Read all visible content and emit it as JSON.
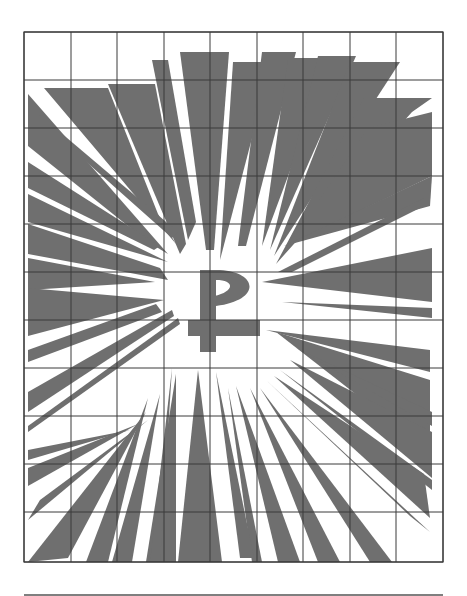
{
  "figure": {
    "center_symbol": "Chi-Rho (P with crossbar)",
    "fill_color": "#6f6f6f",
    "grid_color": "#3a3a3a",
    "background_color": "#ffffff"
  },
  "grid": {
    "left": 24,
    "right": 443,
    "top": 32,
    "bottom": 562,
    "columns": 9,
    "rows": 11,
    "vertical_lines_x": [
      24,
      71,
      117,
      164,
      210,
      257,
      303,
      350,
      396,
      443
    ],
    "horizontal_lines_y": [
      32,
      80,
      128,
      176,
      224,
      272,
      320,
      368,
      416,
      464,
      512,
      562
    ]
  },
  "divider": {
    "x1": 24,
    "x2": 443,
    "y": 595
  },
  "rays": [
    "28,94 28,146 148,242 168,254",
    "44,88 108,88 158,214 176,244",
    "108,84 155,84 186,244 180,254",
    "152,60 168,60 196,222 188,240",
    "180,52 229,52 214,250 206,250",
    "233,62 272,62 220,260",
    "262,52 296,52 246,246 238,246",
    "288,58 332,58 262,246",
    "318,56 356,56 270,250",
    "350,62 400,62 274,256",
    "364,98 432,98 412,112 276,264",
    "368,128 432,112 432,176 288,246",
    "284,246 432,176 430,206",
    "278,272 428,196 428,204 292,272",
    "28,110 34,110 178,232 172,238",
    "28,162 160,246 154,250 28,188",
    "28,194 168,262 28,222",
    "28,224 160,268 168,280 28,254",
    "28,258 155,282 28,290",
    "28,288 164,300 28,336",
    "28,350 156,304 162,312 28,362",
    "28,392 172,310 174,316 28,412",
    "28,426 178,318 180,324 28,432",
    "262,282 432,248 432,302",
    "282,302 432,308 432,318",
    "266,330 430,350 430,372",
    "276,332 430,380 430,452",
    "296,348 432,412 432,426",
    "290,360 432,432 432,478",
    "280,370 432,480 432,490",
    "274,376 424,474 430,518",
    "266,380 410,516 430,532",
    "260,388 392,562 370,562",
    "250,388 340,562 318,562",
    "236,386 300,562 278,562",
    "228,388 262,562 252,562",
    "216,372 254,558 240,558",
    "198,370 222,562 178,562",
    "176,374 176,562 146,562",
    "172,368 160,562 150,562",
    "160,394 132,562 112,562",
    "148,398 108,562 86,562",
    "146,412 68,558 28,562",
    "148,420 40,500 28,520",
    "138,424 28,468 28,486",
    "130,430 28,450 28,460"
  ],
  "chi_rho": {
    "stem": "200,270 216,270 216,352 200,352",
    "loop": "M200,270 L220,270 C258,272 262,300 216,306 L214,296 C234,292 236,280 216,280 L200,280 Z",
    "crossbar": "188,320 260,320 260,336 188,336"
  }
}
